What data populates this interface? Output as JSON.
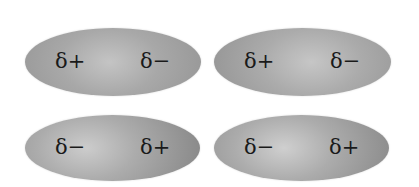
{
  "diagram": {
    "molecules": [
      {
        "position": "top-left",
        "left_label": "δ+",
        "right_label": "δ−"
      },
      {
        "position": "top-right",
        "left_label": "δ+",
        "right_label": "δ−"
      },
      {
        "position": "bottom-left",
        "left_label": "δ−",
        "right_label": "δ+"
      },
      {
        "position": "bottom-right",
        "left_label": "δ−",
        "right_label": "δ+"
      }
    ]
  }
}
